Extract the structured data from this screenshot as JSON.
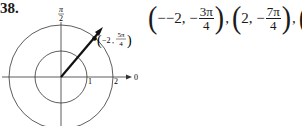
{
  "problem": {
    "number": "38."
  },
  "diagram": {
    "type": "polar-grid",
    "axis_label_top": {
      "num": "π",
      "den": "2"
    },
    "axis_label_right": "0",
    "tick_labels": [
      "1",
      "2"
    ],
    "circles_radii": [
      1,
      2
    ],
    "point": {
      "r": "−2",
      "theta_num": "5π",
      "theta_den": "4",
      "label_prefix": "(−2, ",
      "label_suffix": ")"
    }
  },
  "answer": {
    "pairs": [
      {
        "r": "−2,",
        "sign": "−",
        "num": "3π",
        "den": "4"
      },
      {
        "r": "2,",
        "sign": "−",
        "num": "7π",
        "den": "4"
      },
      {
        "r": "2,",
        "sign": "",
        "num": "π",
        "den": "4"
      }
    ],
    "separator": ","
  }
}
